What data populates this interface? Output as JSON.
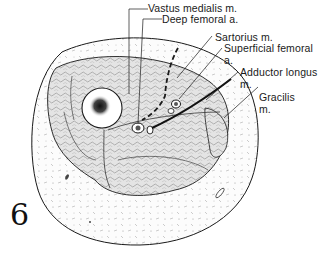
{
  "figure": {
    "number": "6",
    "labels": [
      {
        "id": "vastus-medialis",
        "line1": "Vastus medialis m.",
        "line2": ""
      },
      {
        "id": "deep-femoral",
        "line1": "Deep femoral a.",
        "line2": ""
      },
      {
        "id": "sartorius",
        "line1": "Sartorius m.",
        "line2": ""
      },
      {
        "id": "superficial-femoral",
        "line1": "Superficial femoral",
        "line2": "a."
      },
      {
        "id": "adductor-longus",
        "line1": "Adductor longus",
        "line2": "m."
      },
      {
        "id": "gracilis",
        "line1": "Gracilis",
        "line2": "m."
      }
    ]
  },
  "colors": {
    "ink": "#1a1a1a",
    "skin_fill": "#fbfbfb",
    "muscle_fill": "#e6e6e6",
    "bone_marrow": "#222222",
    "background": "#ffffff"
  }
}
